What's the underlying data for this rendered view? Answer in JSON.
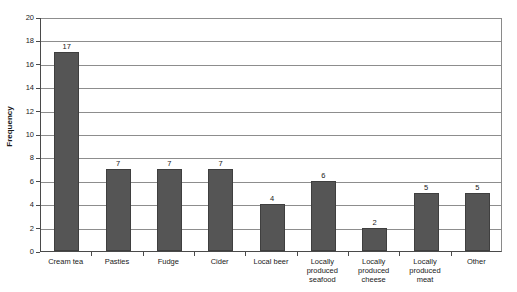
{
  "chart_data": {
    "type": "bar",
    "title": "",
    "subtitle": "",
    "xlabel": "",
    "ylabel": "Frequency",
    "ylim": [
      0,
      20
    ],
    "ytick_step": 2,
    "yticks": [
      0,
      2,
      4,
      6,
      8,
      10,
      12,
      14,
      16,
      18,
      20
    ],
    "grid": true,
    "grid_axis": "y",
    "legend": false,
    "legend_position": "none",
    "bar_color": "#555555",
    "bar_edge_color": "#3f3f3f",
    "gridline_color": "#8d8d8d",
    "axis_color": "#4a4a4a",
    "show_value_labels": true,
    "categories": [
      "Cream tea",
      "Pasties",
      "Fudge",
      "Cider",
      "Local beer",
      "Locally produced seafood",
      "Locally produced cheese",
      "Locally produced meat",
      "Other"
    ],
    "values": [
      17,
      7,
      7,
      7,
      4,
      6,
      2,
      5,
      5
    ],
    "value_labels": [
      "17",
      "7",
      "7",
      "7",
      "4",
      "6",
      "2",
      "5",
      "5"
    ]
  }
}
